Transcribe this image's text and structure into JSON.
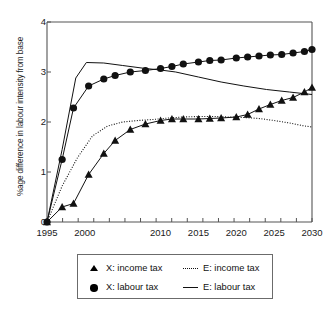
{
  "chart_data": {
    "type": "line",
    "title": "",
    "xlabel": "",
    "ylabel": "%age difference in labour intensity from base",
    "xlim": [
      1995,
      2030
    ],
    "ylim": [
      0,
      4
    ],
    "xticks": [
      1995,
      2000,
      2010,
      2015,
      2020,
      2025,
      2030
    ],
    "xtick_labels": [
      "1995",
      "2000",
      "2010",
      "2015",
      "2020",
      "2025",
      "2030"
    ],
    "yticks": [
      0,
      1,
      2,
      3,
      4
    ],
    "ytick_labels": [
      "0",
      "1",
      "2",
      "3",
      "4"
    ],
    "grid": false,
    "legend_position": "below-axes",
    "x": [
      1995,
      1996,
      1997,
      1998,
      1999,
      2000,
      2001,
      2002,
      2003,
      2004,
      2005,
      2006,
      2007,
      2008,
      2009,
      2010,
      2011,
      2012,
      2013,
      2014,
      2015,
      2016,
      2017,
      2018,
      2019,
      2020,
      2021,
      2022,
      2023,
      2024,
      2025,
      2026,
      2027,
      2028,
      2029,
      2030
    ],
    "series": [
      {
        "name": "X: income tax",
        "key": "x-income-tax",
        "style": "line-marker",
        "marker": "triangle",
        "color": "#111111",
        "x": [
          1995,
          1997,
          1998.5,
          2000.5,
          2002.5,
          2004,
          2006,
          2008,
          2010,
          2011.5,
          2013,
          2015,
          2016.5,
          2018,
          2020,
          2021.5,
          2023,
          2024.5,
          2026,
          2027.5,
          2029,
          2030
        ],
        "values": [
          0.0,
          0.3,
          0.37,
          0.95,
          1.37,
          1.63,
          1.85,
          1.96,
          2.03,
          2.06,
          2.06,
          2.06,
          2.07,
          2.08,
          2.1,
          2.15,
          2.26,
          2.35,
          2.43,
          2.49,
          2.6,
          2.69
        ]
      },
      {
        "name": "X: labour tax",
        "key": "x-labour-tax",
        "style": "line-marker",
        "marker": "circle",
        "color": "#111111",
        "x": [
          1995,
          1997,
          1998.5,
          2000.5,
          2002.5,
          2004,
          2006,
          2008,
          2010,
          2011.5,
          2013,
          2015,
          2016.5,
          2018,
          2020,
          2021.5,
          2023,
          2024.5,
          2026,
          2027.5,
          2029,
          2030
        ],
        "values": [
          0.0,
          1.25,
          2.28,
          2.72,
          2.86,
          2.93,
          3.0,
          3.03,
          3.07,
          3.11,
          3.16,
          3.2,
          3.23,
          3.24,
          3.28,
          3.3,
          3.32,
          3.34,
          3.35,
          3.38,
          3.41,
          3.45
        ]
      },
      {
        "name": "E: income tax",
        "key": "e-income-tax",
        "style": "dotted",
        "marker": "none",
        "color": "#111111",
        "x": [
          1995,
          1997,
          1999,
          2001,
          2003,
          2005,
          2007,
          2009,
          2011,
          2013,
          2015,
          2017,
          2019,
          2021,
          2023,
          2025,
          2027,
          2029,
          2030
        ],
        "values": [
          0.0,
          0.72,
          1.28,
          1.72,
          1.92,
          2.0,
          2.03,
          2.05,
          2.08,
          2.1,
          2.11,
          2.11,
          2.1,
          2.09,
          2.07,
          2.03,
          1.98,
          1.92,
          1.9
        ]
      },
      {
        "name": "E: labour tax",
        "key": "e-labour-tax",
        "style": "solid",
        "marker": "none",
        "color": "#111111",
        "x": [
          1995,
          1997,
          1998.8,
          2000.2,
          2002.5,
          2005,
          2008,
          2010,
          2012,
          2015,
          2018,
          2021,
          2024,
          2027,
          2030
        ],
        "values": [
          0.0,
          1.45,
          2.88,
          3.19,
          3.18,
          3.13,
          3.07,
          3.04,
          3.0,
          2.9,
          2.8,
          2.72,
          2.65,
          2.6,
          2.55
        ]
      }
    ]
  },
  "legend": {
    "entries": [
      {
        "label": "X: income tax",
        "key": "triangle"
      },
      {
        "label": "E: income tax",
        "key": "dotted"
      },
      {
        "label": "X: labour tax",
        "key": "circle"
      },
      {
        "label": "E: labour tax",
        "key": "solid"
      }
    ]
  }
}
